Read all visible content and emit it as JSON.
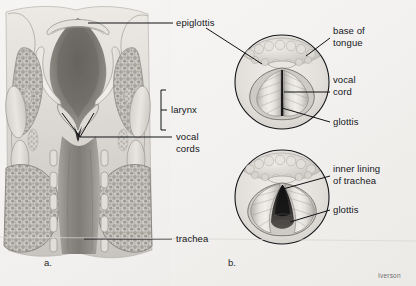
{
  "figure": {
    "background_color": "#f4f4f2",
    "line_color": "#111214",
    "text_color": "#15161a",
    "signature": "Iverson"
  },
  "panels": [
    {
      "id": "a",
      "letter": "a.",
      "caption": "coronal section of larynx and trachea"
    },
    {
      "id": "b",
      "letter": "b.",
      "caption": "laryngoscopic views of vocal cords"
    }
  ],
  "labels": {
    "epiglottis": "epiglottis",
    "larynx": "larynx",
    "vocal_cords": "vocal\ncords",
    "trachea": "trachea",
    "base_of_tongue": "base of\ntongue",
    "vocal_cord": "vocal\ncord",
    "glottis_upper": "glottis",
    "inner_lining_of_trachea": "inner lining\nof trachea",
    "glottis_lower": "glottis"
  },
  "colors": {
    "tissue_light": "#e3e1dd",
    "tissue_mid": "#b9b6b1",
    "tissue_dark": "#8d8a86",
    "cavity_dark": "#6f6c69",
    "cavity_deep": "#4a4845",
    "outline": "#6a6763",
    "glottis_black": "#1b1b1c",
    "circle_stroke": "#15161a"
  }
}
